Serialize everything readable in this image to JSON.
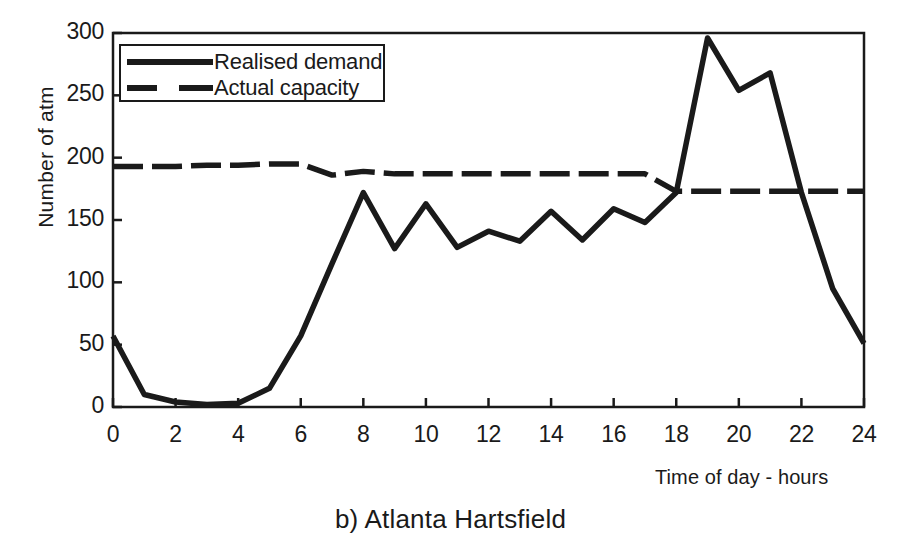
{
  "figure": {
    "caption": "b) Atlanta Hartsfield"
  },
  "chart_data": {
    "type": "line",
    "title": "b) Atlanta Hartsfield",
    "xlabel": "Time of day - hours",
    "ylabel": "Number of atm",
    "xlim": [
      0,
      24
    ],
    "ylim": [
      0,
      300
    ],
    "xticks": [
      0,
      2,
      4,
      6,
      8,
      10,
      12,
      14,
      16,
      18,
      20,
      22,
      24
    ],
    "yticks": [
      0,
      50,
      100,
      150,
      200,
      250,
      300
    ],
    "xtick_labels": [
      "0",
      "2",
      "4",
      "6",
      "8",
      "10",
      "12",
      "14",
      "16",
      "18",
      "20",
      "22",
      "24"
    ],
    "ytick_labels": [
      "0",
      "50",
      "100",
      "150",
      "200",
      "250",
      "300"
    ],
    "grid": false,
    "legend_position": "upper-left-inside",
    "x": [
      0,
      1,
      2,
      3,
      4,
      5,
      6,
      7,
      8,
      9,
      10,
      11,
      12,
      13,
      14,
      15,
      16,
      17,
      18,
      19,
      20,
      21,
      22,
      23,
      24
    ],
    "series": [
      {
        "name": "Realised demand",
        "style": "solid",
        "color": "#1a1a1a",
        "values": [
          57,
          10,
          4,
          2,
          3,
          15,
          57,
          115,
          172,
          127,
          163,
          128,
          141,
          133,
          157,
          134,
          159,
          148,
          172,
          296,
          254,
          268,
          172,
          95,
          51
        ]
      },
      {
        "name": "Actual capacity",
        "style": "dashed",
        "color": "#1a1a1a",
        "values": [
          193,
          193,
          193,
          194,
          194,
          195,
          195,
          186,
          189,
          187,
          187,
          187,
          187,
          187,
          187,
          187,
          187,
          187,
          173,
          173,
          173,
          173,
          173,
          173,
          173
        ]
      }
    ]
  },
  "legend": {
    "items": [
      {
        "label": "Realised demand",
        "style": "solid"
      },
      {
        "label": "Actual capacity",
        "style": "dashed"
      }
    ]
  }
}
